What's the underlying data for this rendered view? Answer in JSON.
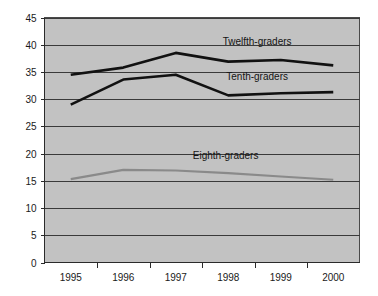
{
  "chart_data": {
    "type": "line",
    "title": "",
    "subtitle": "",
    "xlabel": "",
    "ylabel": "",
    "categories": [
      "1995",
      "1996",
      "1997",
      "1998",
      "1999",
      "2000"
    ],
    "x": [
      1995,
      1996,
      1997,
      1998,
      1999,
      2000
    ],
    "ylim": [
      0,
      45
    ],
    "y_ticks": [
      0,
      5,
      10,
      15,
      20,
      25,
      30,
      35,
      40,
      45
    ],
    "y_tick_labels": [
      "0",
      "5",
      "10",
      "15",
      "20",
      "25",
      "30",
      "35",
      "40",
      "45"
    ],
    "grid": "horizontal",
    "legend": "inline-labels",
    "plot_background": "#c2c2c2",
    "figure_background": "#ffffff",
    "series": [
      {
        "name": "Twelfth-graders",
        "label": "Twelfth-graders",
        "color": "#111111",
        "width": 2.6,
        "values": [
          34.5,
          35.8,
          38.5,
          36.9,
          37.2,
          36.2
        ],
        "label_x": 1998.55,
        "label_y": 39.9
      },
      {
        "name": "Tenth-graders",
        "label": "Tenth-graders",
        "color": "#111111",
        "width": 2.6,
        "values": [
          29.0,
          33.6,
          34.5,
          30.7,
          31.1,
          31.3
        ],
        "label_x": 1998.55,
        "label_y": 33.6
      },
      {
        "name": "Eighth-graders",
        "label": "Eighth-graders",
        "color": "#8a8a8a",
        "width": 2.2,
        "values": [
          15.3,
          17.0,
          16.9,
          16.4,
          15.8,
          15.2
        ],
        "label_x": 1997.95,
        "label_y": 19.1
      }
    ]
  },
  "axes": {
    "y_axis_name": "value-axis",
    "x_axis_name": "year-axis"
  }
}
